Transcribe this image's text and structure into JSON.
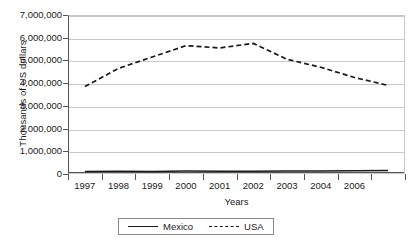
{
  "chart_data": {
    "type": "line",
    "title": "",
    "xlabel": "Years",
    "ylabel": "Thousands of US dollars",
    "categories": [
      "1997",
      "1998",
      "1999",
      "2000",
      "2001",
      "2002",
      "2003",
      "2004",
      "2006",
      ""
    ],
    "ylim": [
      0,
      7000000
    ],
    "ytick_values": [
      0,
      1000000,
      2000000,
      3000000,
      4000000,
      5000000,
      6000000,
      7000000
    ],
    "ytick_labels": [
      "0",
      "1,000,000",
      "2,000,000",
      "3,000,000",
      "4,000,000",
      "5,000,000",
      "6,000,000",
      "7,000,000"
    ],
    "grid": true,
    "legend_position": "bottom",
    "series": [
      {
        "name": "Mexico",
        "style": "solid",
        "color": "#1a1a1a",
        "values": [
          110000,
          120000,
          115000,
          130000,
          120000,
          125000,
          135000,
          130000,
          140000,
          150000
        ]
      },
      {
        "name": "USA",
        "style": "dashed",
        "color": "#1a1a1a",
        "values": [
          3850000,
          4650000,
          5150000,
          5650000,
          5550000,
          5750000,
          5050000,
          4700000,
          4250000,
          3900000
        ]
      }
    ]
  },
  "axes": {
    "y_title": "Thousands of US dollars",
    "x_title": "Years"
  },
  "legend": {
    "entries": [
      {
        "label": "Mexico",
        "style": "solid"
      },
      {
        "label": "USA",
        "style": "dashed"
      }
    ]
  }
}
